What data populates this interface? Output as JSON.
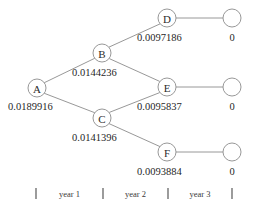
{
  "diagram": {
    "type": "recombining-binomial-tree",
    "title": "",
    "nodes": [
      {
        "id": "A",
        "label": "A",
        "value": "0.0189916",
        "cx": 37,
        "cy": 88,
        "r": 9,
        "label_x": 8,
        "label_y": 110,
        "kind": "internal"
      },
      {
        "id": "B",
        "label": "B",
        "value": "0.0144236",
        "cx": 102,
        "cy": 53,
        "r": 9,
        "label_x": 72,
        "label_y": 76,
        "kind": "internal"
      },
      {
        "id": "C",
        "label": "C",
        "value": "0.0141396",
        "cx": 102,
        "cy": 118,
        "r": 9,
        "label_x": 72,
        "label_y": 141,
        "kind": "internal"
      },
      {
        "id": "D",
        "label": "D",
        "value": "0.0097186",
        "cx": 167,
        "cy": 18,
        "r": 9,
        "label_x": 137,
        "label_y": 41,
        "kind": "internal"
      },
      {
        "id": "E",
        "label": "E",
        "value": "0.0095837",
        "cx": 167,
        "cy": 87,
        "r": 9,
        "label_x": 137,
        "label_y": 110,
        "kind": "internal"
      },
      {
        "id": "F",
        "label": "F",
        "value": "0.0093884",
        "cx": 167,
        "cy": 152,
        "r": 9,
        "label_x": 137,
        "label_y": 175,
        "kind": "internal"
      }
    ],
    "terminals": [
      {
        "id": "T1",
        "value": "0",
        "cx": 232,
        "cy": 18,
        "r": 9,
        "label_x": 232,
        "label_y": 41
      },
      {
        "id": "T2",
        "value": "0",
        "cx": 232,
        "cy": 87,
        "r": 9,
        "label_x": 232,
        "label_y": 110
      },
      {
        "id": "T3",
        "value": "0",
        "cx": 232,
        "cy": 152,
        "r": 9,
        "label_x": 232,
        "label_y": 175
      }
    ],
    "edges": [
      {
        "id": "A-B",
        "from": "A",
        "to": "B",
        "x1": 44.3,
        "y1": 82.7,
        "x2": 94.7,
        "y2": 58.3
      },
      {
        "id": "A-C",
        "from": "A",
        "to": "C",
        "x1": 44.3,
        "y1": 93.3,
        "x2": 94.7,
        "y2": 112.7
      },
      {
        "id": "B-D",
        "from": "B",
        "to": "D",
        "x1": 109.0,
        "y1": 47.1,
        "x2": 160.0,
        "y2": 23.9
      },
      {
        "id": "B-E",
        "from": "B",
        "to": "E",
        "x1": 109.3,
        "y1": 58.6,
        "x2": 159.7,
        "y2": 81.4
      },
      {
        "id": "C-E",
        "from": "C",
        "to": "E",
        "x1": 109.3,
        "y1": 112.4,
        "x2": 159.7,
        "y2": 92.6
      },
      {
        "id": "C-F",
        "from": "C",
        "to": "F",
        "x1": 109.0,
        "y1": 123.6,
        "x2": 160.0,
        "y2": 146.6
      },
      {
        "id": "D-T1",
        "from": "D",
        "to": "T1",
        "x1": 176,
        "y1": 18,
        "x2": 223,
        "y2": 18
      },
      {
        "id": "E-T2",
        "from": "E",
        "to": "T2",
        "x1": 176,
        "y1": 87,
        "x2": 223,
        "y2": 87
      },
      {
        "id": "F-T3",
        "from": "F",
        "to": "T3",
        "x1": 176,
        "y1": 152,
        "x2": 223,
        "y2": 152
      }
    ],
    "timeline": {
      "ticks": [
        {
          "id": "tick-0",
          "x": 36
        },
        {
          "id": "tick-1",
          "x": 103
        },
        {
          "id": "tick-2",
          "x": 168
        },
        {
          "id": "tick-3",
          "x": 232
        }
      ],
      "tick_y_top": 188,
      "tick_y_bottom": 199,
      "periods": [
        {
          "id": "year-1",
          "label": "year 1",
          "x": 69.5,
          "y": 197
        },
        {
          "id": "year-2",
          "label": "year 2",
          "x": 135.5,
          "y": 197
        },
        {
          "id": "year-3",
          "label": "year 3",
          "x": 200,
          "y": 197
        }
      ]
    },
    "colors": {
      "stroke": "#8c8c8c",
      "text": "#1f1f1f",
      "tick": "#4a4a4a",
      "background": "#ffffff"
    }
  }
}
